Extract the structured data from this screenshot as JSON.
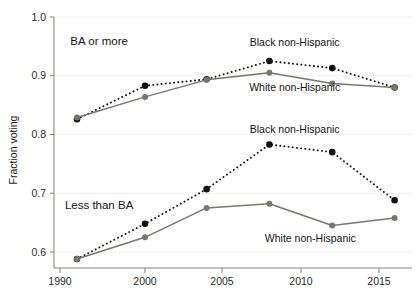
{
  "chart_data": {
    "type": "line",
    "title": "",
    "xlabel": "",
    "ylabel": "Fraction voting",
    "xlim": [
      1990,
      2017
    ],
    "ylim": [
      0.56,
      1.0
    ],
    "yticks": [
      "0.6",
      "0.7",
      "0.8",
      "0.9",
      "1.0"
    ],
    "ytick_values": [
      0.6,
      0.7,
      0.8,
      0.9,
      1.0
    ],
    "xticks": [
      "1990",
      "2000",
      "2005",
      "2010",
      "2015"
    ],
    "xtick_values": [
      1990,
      2000,
      2005,
      2010,
      2015
    ],
    "grid": "horizontal-faint",
    "legend_position": "inline-annotations",
    "x": [
      1992,
      2000,
      2004,
      2008,
      2012,
      2016
    ],
    "groups": [
      {
        "name": "BA or more",
        "label": "BA or more",
        "series": [
          {
            "name": "Black non-Hispanic",
            "label": "Black non-Hispanic",
            "style": "dotted",
            "color": "#111111",
            "values": [
              0.826,
              0.883,
              0.894,
              0.925,
              0.913,
              0.88
            ]
          },
          {
            "name": "White non-Hispanic",
            "label": "White non-Hispanic",
            "style": "solid",
            "color": "#76786f",
            "values": [
              0.829,
              0.864,
              0.893,
              0.905,
              0.887,
              0.88
            ]
          }
        ]
      },
      {
        "name": "Less than BA",
        "label": "Less than BA",
        "series": [
          {
            "name": "Black non-Hispanic",
            "label": "Black non-Hispanic",
            "style": "dotted",
            "color": "#111111",
            "values": [
              0.588,
              0.648,
              0.707,
              0.783,
              0.77,
              0.688
            ]
          },
          {
            "name": "White non-Hispanic",
            "label": "White non-Hispanic",
            "style": "solid",
            "color": "#76786f",
            "values": [
              0.588,
              0.625,
              0.675,
              0.682,
              0.645,
              0.658
            ]
          }
        ]
      }
    ],
    "annotations": [
      {
        "name": "ba-or-more-group-label",
        "text": "BA or more",
        "x": 1994.6,
        "y": 0.952
      },
      {
        "name": "less-than-ba-group-label",
        "text": "Less than BA",
        "x": 1994.6,
        "y": 0.673
      },
      {
        "name": "ba-black-series-label",
        "text": "Black non-Hispanic",
        "x": 2009.6,
        "y": 0.951
      },
      {
        "name": "ba-white-series-label",
        "text": "White non-Hispanic",
        "x": 2009.6,
        "y": 0.874
      },
      {
        "name": "ltba-black-series-label",
        "text": "Black non-Hispanic",
        "x": 2009.6,
        "y": 0.803
      },
      {
        "name": "ltba-white-series-label",
        "text": "White non-Hispanic",
        "x": 2010.6,
        "y": 0.617
      }
    ],
    "colors": {
      "black_series": "#111111",
      "white_series": "#76786f",
      "axis": "#8a8a82",
      "gridline": "#f0f0ee",
      "text": "#1a1a1a"
    }
  }
}
